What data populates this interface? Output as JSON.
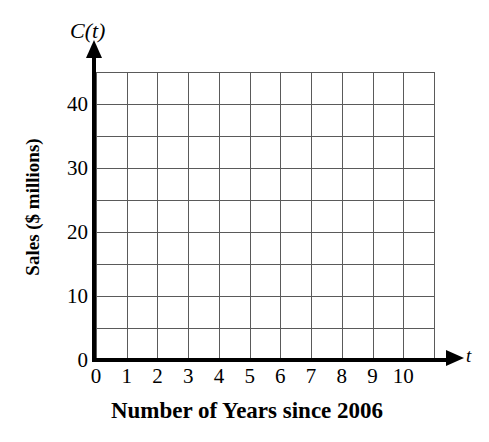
{
  "chart_data": {
    "type": "line",
    "title": "",
    "subtitle": "",
    "xlabel": "Number of Years since 2006",
    "ylabel": "Sales ($ millions)",
    "x_axis_symbol": "t",
    "y_axis_symbol": "C(t)",
    "xlim": [
      0,
      11
    ],
    "ylim": [
      0,
      45
    ],
    "x_ticks": [
      0,
      1,
      2,
      3,
      4,
      5,
      6,
      7,
      8,
      9,
      10
    ],
    "x_tick_labels": [
      "0",
      "1",
      "2",
      "3",
      "4",
      "5",
      "6",
      "7",
      "8",
      "9",
      "10"
    ],
    "y_ticks": [
      0,
      10,
      20,
      30,
      40
    ],
    "y_tick_labels": [
      "0",
      "10",
      "20",
      "30",
      "40"
    ],
    "y_minor_ticks": [
      5,
      15,
      25,
      35
    ],
    "x_grid_step": 1,
    "y_grid_step": 5,
    "grid": true,
    "legend": null,
    "series": [],
    "values": [],
    "categories": [],
    "annotations": [],
    "note": "Empty coordinate grid with no plotted data"
  },
  "axes": {
    "y_symbol": "C(t)",
    "x_symbol": "t",
    "y_title": "Sales ($ millions)",
    "x_title": "Number of Years since 2006"
  },
  "colors": {
    "background": "#ffffff",
    "gridline": "#5a5a5a",
    "axis": "#000000",
    "text": "#000000"
  }
}
